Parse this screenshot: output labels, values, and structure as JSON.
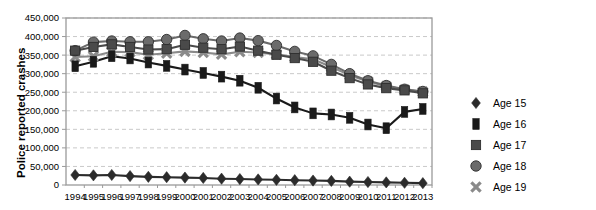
{
  "chart_data": {
    "type": "line",
    "title": "",
    "xlabel": "",
    "ylabel": "Police reported crashes",
    "ylim": [
      0,
      450000
    ],
    "ytick_step": 50000,
    "grid": true,
    "legend_position": "right",
    "categories": [
      "1994",
      "1995",
      "1996",
      "1997",
      "1998",
      "1999",
      "2000",
      "2001",
      "2002",
      "2003",
      "2004",
      "2005",
      "2006",
      "2007",
      "2008",
      "2009",
      "2010",
      "2011",
      "2012",
      "2013"
    ],
    "y_tick_labels": [
      "0",
      "50,000",
      "100,000",
      "150,000",
      "200,000",
      "250,000",
      "300,000",
      "350,000",
      "400,000",
      "450,000"
    ],
    "series": [
      {
        "name": "Age 15",
        "marker": "diamond",
        "color": "#2b2b2b",
        "values": [
          27000,
          26000,
          27000,
          24000,
          22000,
          21000,
          20000,
          19000,
          17000,
          16000,
          15000,
          14000,
          13000,
          12000,
          11000,
          9000,
          8000,
          7000,
          6000,
          5000
        ]
      },
      {
        "name": "Age 16",
        "marker": "tall-rect",
        "color": "#1a1a1a",
        "values": [
          320000,
          332000,
          347000,
          341000,
          330000,
          321000,
          311000,
          302000,
          292000,
          281000,
          262000,
          233000,
          209000,
          193000,
          190000,
          181000,
          163000,
          153000,
          197000,
          205000
        ]
      },
      {
        "name": "Age 17",
        "marker": "square",
        "color": "#4a4a4a",
        "values": [
          362000,
          372000,
          379000,
          372000,
          365000,
          366000,
          378000,
          370000,
          366000,
          373000,
          362000,
          351000,
          342000,
          332000,
          308000,
          288000,
          271000,
          261000,
          255000,
          247000
        ]
      },
      {
        "name": "Age 18",
        "marker": "circle",
        "color": "#6b6b6b",
        "values": [
          362000,
          385000,
          388000,
          386000,
          386000,
          392000,
          403000,
          394000,
          388000,
          396000,
          389000,
          376000,
          360000,
          348000,
          325000,
          300000,
          281000,
          268000,
          258000,
          252000
        ]
      },
      {
        "name": "Age 19",
        "marker": "x",
        "color": "#8a8a8a",
        "values": [
          345000,
          347000,
          359000,
          358000,
          351000,
          355000,
          360000,
          357000,
          352000,
          359000,
          357000,
          352000,
          345000,
          339000,
          318000,
          296000,
          279000,
          266000,
          257000,
          251000
        ]
      }
    ]
  },
  "legend": {
    "items": [
      {
        "label": "Age 15",
        "marker": "diamond"
      },
      {
        "label": "Age 16",
        "marker": "tall-rect"
      },
      {
        "label": "Age 17",
        "marker": "square"
      },
      {
        "label": "Age 18",
        "marker": "circle"
      },
      {
        "label": "Age 19",
        "marker": "x"
      }
    ]
  },
  "colors": {
    "age15": "#2b2b2b",
    "age16": "#1a1a1a",
    "age17": "#4a4a4a",
    "age18": "#6b6b6b",
    "age19": "#8a8a8a",
    "grid": "#c9c9c9",
    "axis": "#9a9a9a",
    "text": "#000000"
  }
}
